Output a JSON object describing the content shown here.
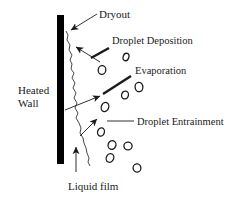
{
  "diagram": {
    "title_implicit": "Annular flow dryout diagram",
    "labels": {
      "dryout": "Dryout",
      "droplet_deposition": "Droplet Deposition",
      "evaporation": "Evaporation",
      "droplet_entrainment": "Droplet Entrainment",
      "heated_wall_line1": "Heated",
      "heated_wall_line2": "Wall",
      "liquid_film": "Liquid film"
    },
    "colors": {
      "ink": "#1a1a1a",
      "background": "#ffffff"
    },
    "droplets": [
      {
        "cx": 126,
        "cy": 57,
        "rx": 2.8,
        "ry": 3.8,
        "tilt": 20
      },
      {
        "cx": 102,
        "cy": 70,
        "rx": 3.8,
        "ry": 4.4,
        "tilt": 10
      },
      {
        "cx": 139,
        "cy": 87,
        "rx": 3.9,
        "ry": 4.7,
        "tilt": -8
      },
      {
        "cx": 125,
        "cy": 95,
        "rx": 3.4,
        "ry": 4.0,
        "tilt": 15
      },
      {
        "cx": 105,
        "cy": 107,
        "rx": 3.7,
        "ry": 4.7,
        "tilt": 20
      },
      {
        "cx": 101,
        "cy": 132,
        "rx": 3.4,
        "ry": 4.2,
        "tilt": 15
      },
      {
        "cx": 112,
        "cy": 145,
        "rx": 3.9,
        "ry": 4.4,
        "tilt": 20
      },
      {
        "cx": 128,
        "cy": 146,
        "rx": 4.1,
        "ry": 3.9,
        "tilt": -5
      },
      {
        "cx": 110,
        "cy": 158,
        "rx": 3.7,
        "ry": 4.4,
        "tilt": 25
      },
      {
        "cx": 137,
        "cy": 168,
        "rx": 3.9,
        "ry": 4.1,
        "tilt": -10
      }
    ]
  }
}
